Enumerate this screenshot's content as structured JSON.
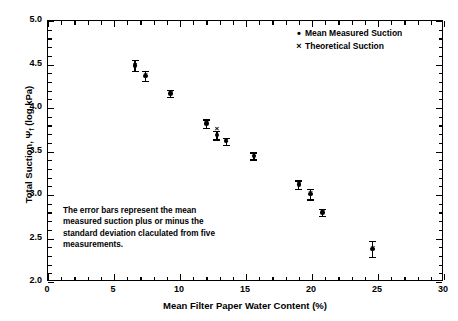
{
  "chart_data": {
    "type": "scatter",
    "title": "",
    "xlabel": "Mean Filter Paper Water Content (%)",
    "ylabel": "Total Suction, Ψ (log kPa)",
    "ylabel_prefix": "Total Suction, Ψ",
    "ylabel_subscript": "f",
    "ylabel_suffix": " (log kPa)",
    "xlim": [
      0,
      30
    ],
    "ylim": [
      2.0,
      5.0
    ],
    "grid": false,
    "legend_position": "top-right",
    "xticks": [
      0,
      5,
      10,
      15,
      20,
      25,
      30
    ],
    "xtick_labels": [
      "0",
      "5",
      "10",
      "15",
      "20",
      "25",
      "30"
    ],
    "xtick_minor_step": 1,
    "yticks": [
      2.0,
      2.5,
      3.0,
      3.5,
      4.0,
      4.5,
      5.0
    ],
    "ytick_labels": [
      "2.0",
      "2.5",
      "3.0",
      "3.5",
      "4.0",
      "4.5",
      "5.0"
    ],
    "ytick_minor_step": 0.1,
    "series": [
      {
        "name": "Mean Measured Suction",
        "marker": "dot",
        "x": [
          6.6,
          7.4,
          9.3,
          12.0,
          12.8,
          13.5,
          15.6,
          19.0,
          19.9,
          20.8,
          24.6
        ],
        "y": [
          4.49,
          4.37,
          4.17,
          3.82,
          3.69,
          3.62,
          3.45,
          3.12,
          3.01,
          2.8,
          2.38
        ],
        "yerr": [
          0.06,
          0.06,
          0.04,
          0.05,
          0.05,
          0.04,
          0.04,
          0.05,
          0.06,
          0.04,
          0.09
        ]
      },
      {
        "name": "Theoretical Suction",
        "marker": "x",
        "x": [
          6.6,
          7.4,
          9.3,
          12.0,
          12.8,
          13.5,
          15.6,
          19.0,
          19.9,
          20.8,
          24.6
        ],
        "y": [
          4.5,
          4.38,
          4.18,
          3.83,
          3.76,
          3.63,
          3.46,
          3.13,
          3.03,
          2.81,
          2.4
        ]
      }
    ],
    "annotation": "The error bars represent the mean measured suction plus or minus the standard deviation claculated from  five measurements.",
    "annotation_lines": [
      "The error bars represent the mean",
      "measured suction plus or minus the",
      "standard deviation claculated from  five",
      "measurements."
    ]
  },
  "legend": {
    "items": [
      {
        "marker": "•",
        "label": "Mean Measured Suction"
      },
      {
        "marker": "×",
        "label": "Theoretical Suction"
      }
    ]
  },
  "colors": {
    "axis": "#000000",
    "marker": "#000000",
    "background": "#ffffff"
  }
}
